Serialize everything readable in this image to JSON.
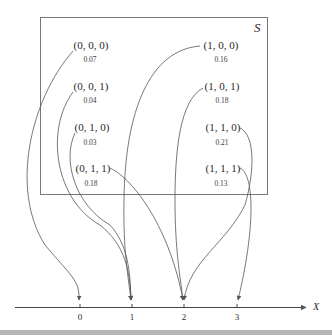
{
  "sample_space": {
    "label": "S",
    "outcomes": [
      {
        "label": "(0, 0, 0)",
        "prob": "0.07",
        "maps_to": 0
      },
      {
        "label": "(0, 0, 1)",
        "prob": "0.04",
        "maps_to": 1
      },
      {
        "label": "(0, 1, 0)",
        "prob": "0.03",
        "maps_to": 1
      },
      {
        "label": "(0, 1, 1)",
        "prob": "0.18",
        "maps_to": 2
      },
      {
        "label": "(1, 0, 0)",
        "prob": "0.16",
        "maps_to": 1
      },
      {
        "label": "(1, 0, 1)",
        "prob": "0.18",
        "maps_to": 2
      },
      {
        "label": "(1, 1, 0)",
        "prob": "0.21",
        "maps_to": 2
      },
      {
        "label": "(1, 1, 1)",
        "prob": "0.13",
        "maps_to": 3
      }
    ]
  },
  "axis": {
    "label": "X",
    "ticks": [
      "0",
      "1",
      "2",
      "3"
    ]
  },
  "colors": {
    "line": "#555555",
    "box": "#777777",
    "text": "#2a2a2a"
  }
}
